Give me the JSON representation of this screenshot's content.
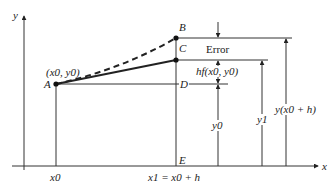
{
  "diagram": {
    "axes": {
      "x_label": "x",
      "y_label": "y"
    },
    "points": [
      {
        "id": "A",
        "label": "A",
        "coord_label": "(x0, y0)"
      },
      {
        "id": "B",
        "label": "B"
      },
      {
        "id": "C",
        "label": "C"
      },
      {
        "id": "D",
        "label": "D"
      },
      {
        "id": "E",
        "label": "E"
      }
    ],
    "x_ticks": {
      "x0": "x0",
      "x1": "x1 = x0 + h"
    },
    "measures": {
      "error": "Error",
      "step": "hf(x0, y0)",
      "y0": "y0",
      "y1": "y1",
      "exact": "y(x0 + h)"
    },
    "curves": [
      {
        "name": "true solution",
        "style": "dashed",
        "from": "A",
        "to": "B"
      },
      {
        "name": "Euler tangent step",
        "style": "solid",
        "from": "A",
        "to": "C"
      }
    ]
  }
}
